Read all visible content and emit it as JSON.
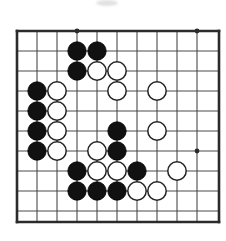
{
  "figure": {
    "kind": "go-board-diagram",
    "game": "Go",
    "board": {
      "visible_columns": 10,
      "visible_rows": 10,
      "origin_x": 17,
      "origin_y": 31,
      "spacing": 20,
      "stone_radius": 9.2,
      "line_color": "#4a4a4a",
      "edge_color": "#2b2b2b",
      "line_width": 1.1,
      "edge_width": 2.6,
      "background_color": "#ffffff",
      "edges": {
        "left": true,
        "top": true,
        "right": true,
        "bottom": true
      },
      "right_edge_x": 219,
      "bottom_edge_y": 222
    },
    "star_points": [
      {
        "col": 4,
        "row": 1
      },
      {
        "col": 10,
        "row": 1
      },
      {
        "col": 10,
        "row": 7
      }
    ],
    "star_point_radius": 2.4,
    "colors": {
      "black_stone_fill": "#111111",
      "black_stone_stroke": "#000000",
      "white_stone_fill": "#ffffff",
      "white_stone_stroke": "#222222"
    },
    "stones": [
      {
        "col": 4,
        "row": 2,
        "color": "black"
      },
      {
        "col": 5,
        "row": 2,
        "color": "black"
      },
      {
        "col": 4,
        "row": 3,
        "color": "black"
      },
      {
        "col": 5,
        "row": 3,
        "color": "white"
      },
      {
        "col": 6,
        "row": 3,
        "color": "white"
      },
      {
        "col": 2,
        "row": 4,
        "color": "black"
      },
      {
        "col": 3,
        "row": 4,
        "color": "white"
      },
      {
        "col": 6,
        "row": 4,
        "color": "white"
      },
      {
        "col": 8,
        "row": 4,
        "color": "white"
      },
      {
        "col": 2,
        "row": 5,
        "color": "black"
      },
      {
        "col": 3,
        "row": 5,
        "color": "white"
      },
      {
        "col": 2,
        "row": 6,
        "color": "black"
      },
      {
        "col": 3,
        "row": 6,
        "color": "white"
      },
      {
        "col": 6,
        "row": 6,
        "color": "black"
      },
      {
        "col": 8,
        "row": 6,
        "color": "white"
      },
      {
        "col": 2,
        "row": 7,
        "color": "black"
      },
      {
        "col": 3,
        "row": 7,
        "color": "white"
      },
      {
        "col": 5,
        "row": 7,
        "color": "white"
      },
      {
        "col": 6,
        "row": 7,
        "color": "black"
      },
      {
        "col": 4,
        "row": 8,
        "color": "black"
      },
      {
        "col": 5,
        "row": 8,
        "color": "white"
      },
      {
        "col": 6,
        "row": 8,
        "color": "white"
      },
      {
        "col": 7,
        "row": 8,
        "color": "black"
      },
      {
        "col": 9,
        "row": 8,
        "color": "white"
      },
      {
        "col": 4,
        "row": 9,
        "color": "black"
      },
      {
        "col": 5,
        "row": 9,
        "color": "black"
      },
      {
        "col": 6,
        "row": 9,
        "color": "black"
      },
      {
        "col": 7,
        "row": 9,
        "color": "white"
      },
      {
        "col": 8,
        "row": 9,
        "color": "white"
      }
    ],
    "stone_counts": {
      "black": 15,
      "white": 14,
      "total": 29
    },
    "artifacts": [
      {
        "name": "scan-smudge",
        "x": 96,
        "y": 0,
        "width": 22,
        "height": 6
      }
    ]
  }
}
